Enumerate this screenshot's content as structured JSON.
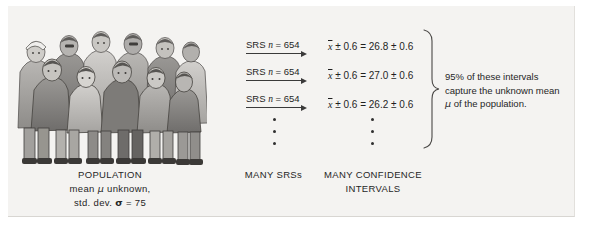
{
  "figure": {
    "background_color": "#f4f3f1",
    "ink_color": "#2b2b2b"
  },
  "population": {
    "illustration_name": "crowd-of-people-illustration",
    "caption_line1": "POPULATION",
    "caption_line2_prefix": "mean ",
    "caption_line2_symbol": "μ",
    "caption_line2_suffix": " unknown,",
    "caption_line3_prefix": "std. dev. ",
    "caption_line3_symbol": "σ",
    "caption_line3_suffix": " = 75"
  },
  "samples": {
    "caption": "MANY SRSs",
    "arrows": [
      {
        "label_prefix": "SRS ",
        "label_var": "n",
        "label_suffix": " = 654"
      },
      {
        "label_prefix": "SRS ",
        "label_var": "n",
        "label_suffix": " = 654"
      },
      {
        "label_prefix": "SRS ",
        "label_var": "n",
        "label_suffix": " = 654"
      }
    ],
    "ellipsis_dots": 3
  },
  "intervals": {
    "caption_line1": "MANY CONFIDENCE",
    "caption_line2": "INTERVALS",
    "items": [
      {
        "lhs_bar": "x",
        "lhs_margin": "± 0.6",
        "equals": "=",
        "center": "26.8",
        "margin": "± 0.6"
      },
      {
        "lhs_bar": "x",
        "lhs_margin": "± 0.6",
        "equals": "=",
        "center": "27.0",
        "margin": "± 0.6"
      },
      {
        "lhs_bar": "x",
        "lhs_margin": "± 0.6",
        "equals": "=",
        "center": "26.2",
        "margin": "± 0.6"
      }
    ],
    "ellipsis_dots": 3
  },
  "conclusion": {
    "line1": "95% of these intervals",
    "line2": "capture the unknown mean",
    "line3_symbol": "μ",
    "line3_suffix": " of the population."
  }
}
